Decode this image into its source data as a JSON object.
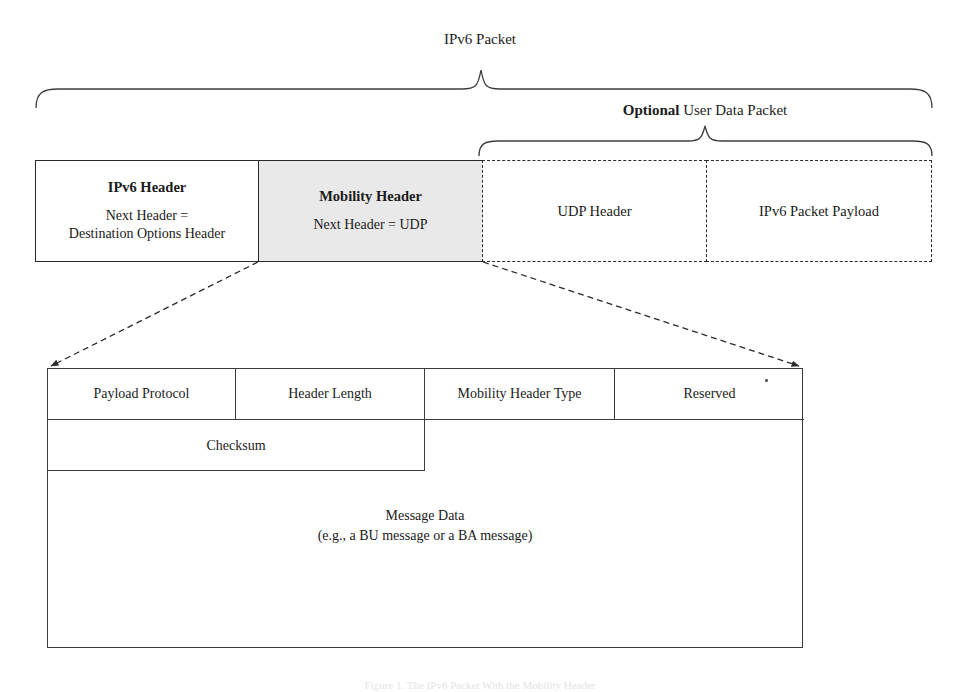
{
  "figure": {
    "top_label": "IPv6 Packet",
    "optional_label_bold": "Optional",
    "optional_label_rest": " User Data Packet",
    "caption": "Figure 1. The IPv6 Packet With the Mobility Header"
  },
  "packet_row": {
    "boxes": [
      {
        "name": "ipv6-header",
        "title": "IPv6 Header",
        "sub_line1": "Next Header =",
        "sub_line2": "Destination Options Header",
        "border": "solid",
        "fill": "#ffffff"
      },
      {
        "name": "mobility-header",
        "title": "Mobility Header",
        "sub_line1": "Next Header = UDP",
        "sub_line2": "",
        "border": "solid",
        "fill": "#e9e9e9"
      },
      {
        "name": "udp-header",
        "title": "",
        "sub_line1": "UDP Header",
        "sub_line2": "",
        "border": "dashed",
        "fill": "#ffffff"
      },
      {
        "name": "ipv6-packet-payload",
        "title": "",
        "sub_line1": "IPv6 Packet Payload",
        "sub_line2": "",
        "border": "dashed",
        "fill": "#ffffff"
      }
    ]
  },
  "mobility_header_detail": {
    "row1": [
      "Payload Protocol",
      "Header Length",
      "Mobility Header Type",
      "Reserved"
    ],
    "row2": [
      "Checksum"
    ],
    "message_data_line1": "Message Data",
    "message_data_line2": "(e.g., a BU message or a BA message)"
  },
  "colors": {
    "stroke": "#2b2b2b",
    "table_stroke": "#3a3a3a",
    "mobility_fill": "#e9e9e9",
    "text": "#1c1c1c"
  }
}
